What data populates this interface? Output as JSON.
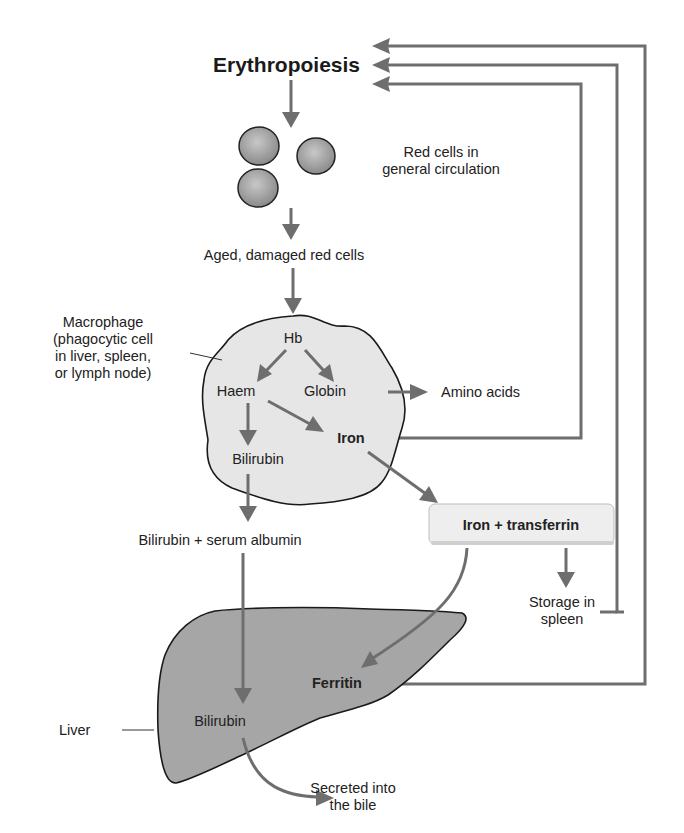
{
  "diagram": {
    "title": "Erythropoiesis",
    "nodes": {
      "red_cells": [
        "Red cells in",
        "general circulation"
      ],
      "aged": "Aged, damaged red cells",
      "macrophage_label": [
        "Macrophage",
        "(phagocytic cell",
        "in liver, spleen,",
        "or lymph node)"
      ],
      "hb": "Hb",
      "haem": "Haem",
      "globin": "Globin",
      "amino_acids": "Amino acids",
      "iron": "Iron",
      "bilirubin_macrophage": "Bilirubin",
      "bilirubin_albumin": "Bilirubin + serum albumin",
      "iron_transferrin": "Iron + transferrin",
      "storage": [
        "Storage in",
        "spleen"
      ],
      "ferritin": "Ferritin",
      "liver_label": "Liver",
      "bilirubin_liver": "Bilirubin",
      "secreted": [
        "Secreted into",
        "the bile"
      ]
    },
    "colors": {
      "arrow": "#6e6e6e",
      "macrophage_fill": "#e6e6e6",
      "liver_fill": "#a6a6a6",
      "cell_fill": "#9a9a9a",
      "box_fill": "#eeeeee"
    }
  }
}
